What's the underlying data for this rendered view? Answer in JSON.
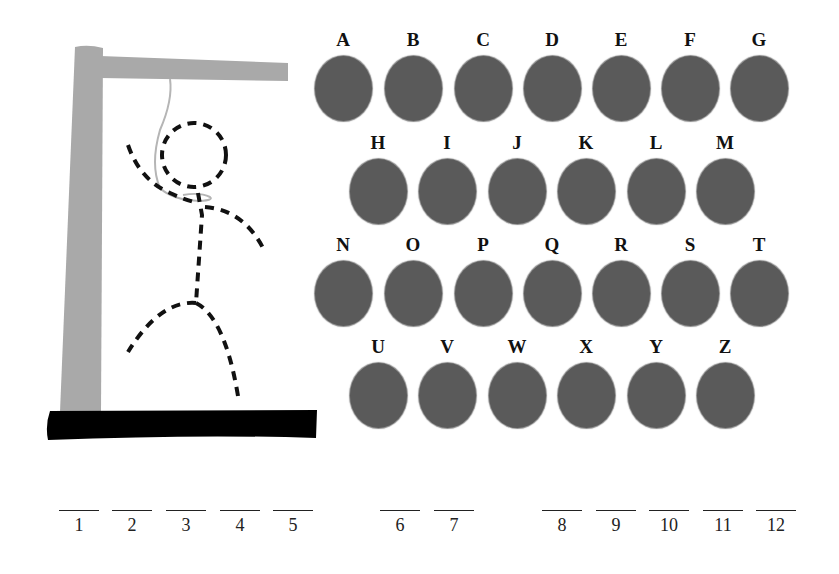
{
  "game": "hangman",
  "colors": {
    "gallows": "#a9a9a9",
    "base": "#000000",
    "rope": "#b5b5b5",
    "figure": "#111111",
    "letter_disc": "#5a5a5a",
    "letter_text": "#111111"
  },
  "letters": [
    {
      "label": "A",
      "x": 313,
      "y": 28
    },
    {
      "label": "B",
      "x": 383,
      "y": 28
    },
    {
      "label": "C",
      "x": 453,
      "y": 28
    },
    {
      "label": "D",
      "x": 522,
      "y": 28
    },
    {
      "label": "E",
      "x": 591,
      "y": 28
    },
    {
      "label": "F",
      "x": 660,
      "y": 28
    },
    {
      "label": "G",
      "x": 729,
      "y": 28
    },
    {
      "label": "H",
      "x": 348,
      "y": 131
    },
    {
      "label": "I",
      "x": 417,
      "y": 131
    },
    {
      "label": "J",
      "x": 487,
      "y": 131
    },
    {
      "label": "K",
      "x": 556,
      "y": 131
    },
    {
      "label": "L",
      "x": 626,
      "y": 131
    },
    {
      "label": "M",
      "x": 695,
      "y": 131
    },
    {
      "label": "N",
      "x": 313,
      "y": 233
    },
    {
      "label": "O",
      "x": 383,
      "y": 233
    },
    {
      "label": "P",
      "x": 453,
      "y": 233
    },
    {
      "label": "Q",
      "x": 522,
      "y": 233
    },
    {
      "label": "R",
      "x": 591,
      "y": 233
    },
    {
      "label": "S",
      "x": 660,
      "y": 233
    },
    {
      "label": "T",
      "x": 729,
      "y": 233
    },
    {
      "label": "U",
      "x": 348,
      "y": 335
    },
    {
      "label": "V",
      "x": 417,
      "y": 335
    },
    {
      "label": "W",
      "x": 487,
      "y": 335
    },
    {
      "label": "X",
      "x": 556,
      "y": 335
    },
    {
      "label": "Y",
      "x": 626,
      "y": 335
    },
    {
      "label": "Z",
      "x": 695,
      "y": 335
    }
  ],
  "blanks": [
    {
      "number": "1",
      "x": 59
    },
    {
      "number": "2",
      "x": 112
    },
    {
      "number": "3",
      "x": 166
    },
    {
      "number": "4",
      "x": 220
    },
    {
      "number": "5",
      "x": 273
    },
    {
      "number": "6",
      "x": 380
    },
    {
      "number": "7",
      "x": 434
    },
    {
      "number": "8",
      "x": 542
    },
    {
      "number": "9",
      "x": 596
    },
    {
      "number": "10",
      "x": 649
    },
    {
      "number": "11",
      "x": 703
    },
    {
      "number": "12",
      "x": 756
    }
  ]
}
